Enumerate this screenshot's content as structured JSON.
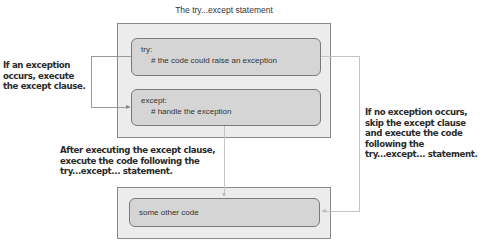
{
  "diagram": {
    "title": "The try...except statement",
    "blocks": {
      "try": {
        "line1": "try:",
        "line2": "# the code could raise an exception"
      },
      "except": {
        "line1": "except:",
        "line2": "# handle the exception"
      },
      "other": {
        "line1": "some other code"
      }
    },
    "notes": {
      "left": "If an exception\noccurs, execute\nthe except clause.",
      "middle": "After executing the except clause,\nexecute the code following the\ntry...except... statement.",
      "right": "If no exception occurs,\nskip the except clause\nand execute the code\nfollowing the\ntry...except... statement."
    },
    "colors": {
      "outer_fill": "#ececec",
      "inner_fill": "#d5d5d5",
      "border": "#7a7a7a",
      "text": "#333333"
    }
  }
}
